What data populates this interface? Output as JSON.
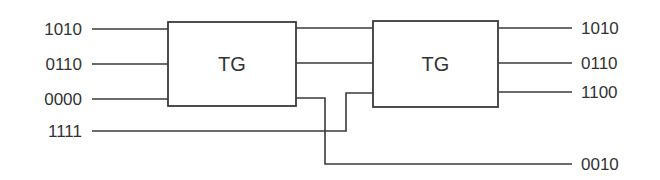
{
  "diagram": {
    "title": "",
    "stroke_color": "#3a3a3a",
    "text_color": "#333333",
    "gates": [
      {
        "id": "tg1",
        "label": "TG",
        "x": 168,
        "y": 22,
        "w": 128,
        "h": 84
      },
      {
        "id": "tg2",
        "label": "TG",
        "x": 373,
        "y": 21,
        "w": 125,
        "h": 86
      }
    ],
    "inputs": [
      {
        "label": "1010",
        "y": 29
      },
      {
        "label": "0110",
        "y": 64
      },
      {
        "label": "0000",
        "y": 99
      },
      {
        "label": "1111",
        "y": 131
      }
    ],
    "outputs": [
      {
        "label": "1010",
        "y": 28
      },
      {
        "label": "0110",
        "y": 63
      },
      {
        "label": "1100",
        "y": 92
      },
      {
        "label": "0010",
        "y": 164
      }
    ],
    "wires": [
      {
        "name": "in-1010-to-tg1",
        "points": [
          [
            92,
            29
          ],
          [
            168,
            29
          ]
        ]
      },
      {
        "name": "in-0110-to-tg1",
        "points": [
          [
            92,
            64
          ],
          [
            168,
            64
          ]
        ]
      },
      {
        "name": "in-0000-to-tg1",
        "points": [
          [
            92,
            99
          ],
          [
            168,
            99
          ]
        ]
      },
      {
        "name": "tg1-out1-to-tg2-in1",
        "points": [
          [
            296,
            28
          ],
          [
            373,
            28
          ]
        ]
      },
      {
        "name": "tg1-out2-to-tg2-in2",
        "points": [
          [
            296,
            63
          ],
          [
            373,
            63
          ]
        ]
      },
      {
        "name": "tg1-out3-to-out-0010",
        "points": [
          [
            296,
            98
          ],
          [
            325,
            98
          ],
          [
            325,
            164
          ],
          [
            572,
            164
          ]
        ]
      },
      {
        "name": "in-1111-to-tg2-in3",
        "points": [
          [
            92,
            131
          ],
          [
            346,
            131
          ],
          [
            346,
            93
          ],
          [
            373,
            93
          ]
        ]
      },
      {
        "name": "tg2-out1-to-out-1010",
        "points": [
          [
            498,
            28
          ],
          [
            572,
            28
          ]
        ]
      },
      {
        "name": "tg2-out2-to-out-0110",
        "points": [
          [
            498,
            63
          ],
          [
            572,
            63
          ]
        ]
      },
      {
        "name": "tg2-out3-to-out-1100",
        "points": [
          [
            498,
            92
          ],
          [
            572,
            92
          ]
        ]
      }
    ]
  }
}
